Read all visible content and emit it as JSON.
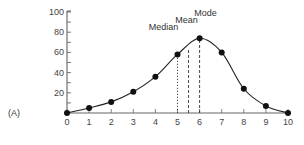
{
  "chart_data": {
    "type": "line",
    "panel_label": "(A)",
    "title": "",
    "xlabel": "",
    "ylabel": "",
    "x": [
      0,
      1,
      2,
      3,
      4,
      5,
      6,
      7,
      8,
      9,
      10
    ],
    "series": [
      {
        "name": "distribution",
        "values": [
          0,
          5,
          11,
          21,
          36,
          58,
          74,
          60,
          24,
          7,
          0
        ],
        "markers": "filled-circle",
        "smooth": true
      }
    ],
    "xlim": [
      0,
      10
    ],
    "ylim": [
      0,
      100
    ],
    "x_ticks": [
      "0",
      "1",
      "2",
      "3",
      "4",
      "5",
      "6",
      "7",
      "8",
      "9",
      "10"
    ],
    "y_ticks": [
      "20",
      "40",
      "60",
      "80",
      "100"
    ],
    "grid": false,
    "legend": null,
    "annotations": [
      {
        "label": "Median",
        "x": 5,
        "style": "dotted"
      },
      {
        "label": "Mean",
        "x": 5.5,
        "style": "dashed"
      },
      {
        "label": "Mode",
        "x": 6,
        "style": "dashed"
      }
    ]
  }
}
